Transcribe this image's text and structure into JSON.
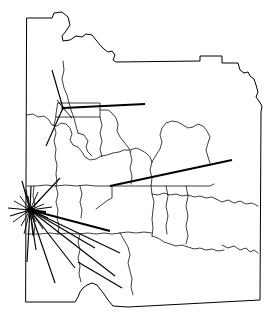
{
  "figure": {
    "region_name": "New York",
    "background_color": "#ffffff",
    "line_color": "#000000",
    "width": 269,
    "height": 323
  },
  "map": {
    "state_outline_path": "M 27,18 L 52,18 L 54,13 L 62,12 L 68,17 L 70,25 L 66,31 L 62,36 L 63,41 L 70,40 L 76,36 L 82,37 L 86,34 L 92,35 L 96,40 L 100,45 L 104,49 L 108,52 L 112,51 L 115,55 L 113,60 L 116,62 L 200,61 L 200,56 L 222,56 L 222,63 L 238,63 L 240,70 L 244,73 L 248,72 L 250,76 L 254,79 L 256,85 L 258,92 L 256,97 L 259,101 L 262,106 L 261,112 L 260,300 L 128,307 L 113,306 L 108,300 L 104,294 L 100,289 L 97,285 L 92,283 L 87,285 L 83,288 L 80,292 L 78,297 L 75,302 L 26,302 Z",
    "county_lines": [
      "M 27,115 L 33,114 L 38,117 L 44,116 L 49,120 L 52,125 L 57,126 L 61,123 L 66,124 L 70,128 L 72,134 L 70,140 L 73,145 L 78,147 L 82,152 L 85,157 L 90,160 L 96,159 L 101,156 L 107,155 L 113,153 L 119,152 L 124,150 L 130,150 L 136,148 L 141,150 L 146,153 L 150,157 L 152,162",
      "M 63,61 L 64,70 L 62,79 L 64,88 L 67,95 L 69,103 L 71,110 L 74,118 L 76,126 L 78,133",
      "M 58,103 L 100,103 L 100,117 L 56,117 Z",
      "M 78,133 L 84,135 L 88,141 L 86,147 L 88,152 L 92,156",
      "M 100,110 L 108,110 L 112,113 L 116,118 L 118,124 L 117,131 L 120,137 L 124,142 L 128,147 L 131,152",
      "M 152,162 L 156,155 L 160,149 L 162,142 L 160,135 L 162,128 L 166,123 L 172,121 L 178,122 L 183,125 L 188,128 L 193,127 L 198,124 L 203,126 L 207,131 L 210,137 L 208,143 L 206,150 L 208,157 L 210,163",
      "M 152,162 L 150,170 L 152,178 L 151,186 L 152,194 L 154,202 L 153,210 L 152,219 L 153,228 L 152,236",
      "M 110,186 L 152,186 L 210,186 L 214,184",
      "M 112,186 L 112,198 L 108,200 L 104,203 L 100,206 L 96,209",
      "M 130,152 L 132,160 L 130,168 L 132,176 L 131,184",
      "M 80,186 L 82,194 L 80,202 L 82,210 L 81,218",
      "M 56,186 L 58,194 L 56,202 L 58,210 L 57,218 L 59,226 L 58,234",
      "M 27,234 L 40,234 L 50,233 L 58,234 L 68,233 L 78,234 L 88,233 L 96,234 L 104,233 L 112,234 L 120,233",
      "M 120,233 L 124,240 L 128,247 L 130,255 L 128,263 L 130,271 L 132,279 L 131,287 L 133,295",
      "M 152,236 L 158,238 L 164,242 L 170,244 L 176,246 L 182,245 L 188,247 L 194,249 L 200,248 L 206,250 L 212,249 L 218,251 L 224,250",
      "M 152,194 L 158,195 L 164,193 L 170,195 L 176,194 L 182,196 L 188,195 L 194,197 L 200,196 L 206,198 L 212,197 L 216,199",
      "M 186,186 L 188,196 L 186,206 L 188,216 L 186,226 L 188,236 L 186,244",
      "M 166,186 L 168,196 L 166,206 L 168,216 L 166,226 L 167,234",
      "M 216,199 L 222,202 L 228,200 L 234,203 L 240,201 L 246,204 L 252,203 L 258,206",
      "M 222,245 L 228,248 L 234,246 L 240,250 L 246,248 L 250,252 L 254,250 L 258,253",
      "M 27,186 L 36,186 L 46,185 L 56,186 L 66,185 L 76,186 L 86,185 L 96,186 L 104,186 L 110,186",
      "M 100,117 L 102,125 L 100,133 L 102,141 L 100,149 L 102,157",
      "M 56,117 L 54,125 L 56,133 L 54,141 L 56,149 L 55,157 L 57,165 L 56,174 L 57,182 L 56,186",
      "M 120,233 L 128,232 L 136,233 L 144,232 L 152,233",
      "M 80,234 L 78,242 L 80,250 L 78,258 L 80,266 L 79,274 L 81,282",
      "M 34,186 L 33,196 L 35,206 L 33,216 L 35,226 L 34,234"
    ]
  },
  "flows": {
    "hubs": [
      {
        "id": "hub-primary",
        "label": "primary-origin-hub",
        "x": 30,
        "y": 210,
        "radius": 3.2
      },
      {
        "id": "hub-secondary",
        "label": "secondary-origin-hub",
        "x": 63,
        "y": 108,
        "radius": 1.6
      }
    ],
    "lines": [
      {
        "from_hub": "hub-secondary",
        "x1": 63,
        "y1": 108,
        "x2": 145,
        "y2": 104,
        "weight": "heavy"
      },
      {
        "from_hub": "hub-secondary",
        "x1": 63,
        "y1": 108,
        "x2": 52,
        "y2": 70,
        "weight": "normal"
      },
      {
        "from_hub": "hub-secondary",
        "x1": 63,
        "y1": 108,
        "x2": 46,
        "y2": 146,
        "weight": "normal"
      },
      {
        "from_hub": "hub-secondary",
        "x1": 63,
        "y1": 108,
        "x2": 72,
        "y2": 118,
        "weight": "light"
      },
      {
        "from_hub": "hub-secondary",
        "x1": 63,
        "y1": 108,
        "x2": 57,
        "y2": 100,
        "weight": "light"
      },
      {
        "from_hub": "hub-primary",
        "x1": 30,
        "y1": 210,
        "x2": 110,
        "y2": 231,
        "weight": "heavy"
      },
      {
        "from_hub": "hub-primary",
        "x1": 30,
        "y1": 210,
        "x2": 60,
        "y2": 178,
        "weight": "normal"
      },
      {
        "from_hub": "hub-primary",
        "x1": 30,
        "y1": 210,
        "x2": 22,
        "y2": 181,
        "weight": "normal"
      },
      {
        "from_hub": "hub-primary",
        "x1": 30,
        "y1": 210,
        "x2": 55,
        "y2": 283,
        "weight": "normal"
      },
      {
        "from_hub": "hub-primary",
        "x1": 30,
        "y1": 210,
        "x2": 115,
        "y2": 276,
        "weight": "normal"
      },
      {
        "from_hub": "hub-primary",
        "x1": 30,
        "y1": 210,
        "x2": 120,
        "y2": 253,
        "weight": "normal"
      },
      {
        "from_hub": "hub-primary",
        "x1": 30,
        "y1": 210,
        "x2": 36,
        "y2": 250,
        "weight": "normal"
      },
      {
        "from_hub": "hub-primary",
        "x1": 30,
        "y1": 210,
        "x2": 27,
        "y2": 262,
        "weight": "normal"
      },
      {
        "from_hub": "hub-primary",
        "x1": 30,
        "y1": 210,
        "x2": 8,
        "y2": 208,
        "weight": "normal"
      },
      {
        "from_hub": "hub-primary",
        "x1": 30,
        "y1": 210,
        "x2": 10,
        "y2": 216,
        "weight": "normal"
      },
      {
        "from_hub": "hub-primary",
        "x1": 30,
        "y1": 210,
        "x2": 14,
        "y2": 201,
        "weight": "light"
      },
      {
        "from_hub": "hub-primary",
        "x1": 30,
        "y1": 210,
        "x2": 13,
        "y2": 222,
        "weight": "light"
      },
      {
        "from_hub": "hub-primary",
        "x1": 30,
        "y1": 210,
        "x2": 46,
        "y2": 212,
        "weight": "heavy"
      },
      {
        "from_hub": "hub-primary",
        "x1": 30,
        "y1": 210,
        "x2": 52,
        "y2": 207,
        "weight": "normal"
      },
      {
        "from_hub": "hub-primary",
        "x1": 30,
        "y1": 210,
        "x2": 48,
        "y2": 218,
        "weight": "normal"
      },
      {
        "from_hub": "hub-primary",
        "x1": 30,
        "y1": 210,
        "x2": 31,
        "y2": 186,
        "weight": "normal"
      },
      {
        "from_hub": "hub-primary",
        "x1": 30,
        "y1": 210,
        "x2": 26,
        "y2": 190,
        "weight": "light"
      },
      {
        "from_hub": "hub-primary",
        "x1": 30,
        "y1": 210,
        "x2": 38,
        "y2": 192,
        "weight": "light"
      },
      {
        "from_hub": "hub-primary",
        "x1": 30,
        "y1": 210,
        "x2": 33,
        "y2": 236,
        "weight": "light"
      },
      {
        "from_hub": "hub-primary",
        "x1": 30,
        "y1": 210,
        "x2": 24,
        "y2": 234,
        "weight": "light"
      },
      {
        "from_hub": "hub-primary",
        "x1": 30,
        "y1": 210,
        "x2": 43,
        "y2": 229,
        "weight": "light"
      },
      {
        "from_hub": "hub-primary",
        "x1": 30,
        "y1": 210,
        "x2": 40,
        "y2": 200,
        "weight": "light"
      },
      {
        "from_hub": "hub-primary",
        "x1": 30,
        "y1": 210,
        "x2": 20,
        "y2": 196,
        "weight": "light"
      },
      {
        "from_hub": "hub-primary",
        "x1": 30,
        "y1": 210,
        "x2": 44,
        "y2": 204,
        "weight": "light"
      },
      {
        "from_hub": "hub-primary",
        "x1": 30,
        "y1": 210,
        "x2": 21,
        "y2": 226,
        "weight": "light"
      },
      {
        "from_hub": "hub-primary",
        "x1": 30,
        "y1": 210,
        "x2": 36,
        "y2": 222,
        "weight": "light"
      },
      {
        "from_hub": "hub-primary",
        "x1": 30,
        "y1": 210,
        "x2": 28,
        "y2": 196,
        "weight": "light"
      },
      {
        "from_hub": "hub-primary",
        "x1": 30,
        "y1": 210,
        "x2": 95,
        "y2": 248,
        "weight": "normal"
      },
      {
        "from_hub": "hub-primary",
        "x1": 30,
        "y1": 210,
        "x2": 75,
        "y2": 268,
        "weight": "normal"
      },
      {
        "from_hub": null,
        "x1": 110,
        "y1": 186,
        "x2": 232,
        "y2": 160,
        "weight": "heavy"
      },
      {
        "from_hub": null,
        "x1": 78,
        "y1": 262,
        "x2": 122,
        "y2": 288,
        "weight": "normal"
      }
    ]
  },
  "legend": {
    "present": false
  }
}
